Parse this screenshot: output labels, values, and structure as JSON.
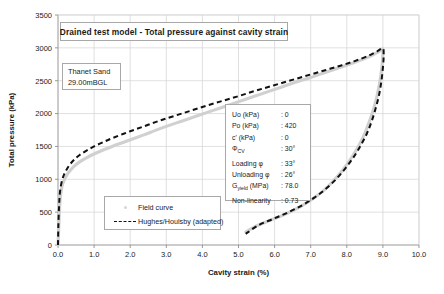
{
  "chart_data": {
    "type": "line",
    "title": "Drained test model - Total pressure against cavity strain",
    "xlabel": "Cavity strain (%)",
    "ylabel": "Total pressure (kPa)",
    "xlim": [
      0.0,
      10.0
    ],
    "ylim": [
      0,
      3500
    ],
    "xticks": [
      "0.0",
      "1.0",
      "2.0",
      "3.0",
      "4.0",
      "5.0",
      "6.0",
      "7.0",
      "8.0",
      "9.0",
      "10.0"
    ],
    "yticks": [
      "0",
      "500",
      "1000",
      "1500",
      "2000",
      "2500",
      "3000",
      "3500"
    ],
    "grid": true,
    "legend_position": "inside-left-lower",
    "series": [
      {
        "name": "Field curve",
        "style": "thick-light-gray-line",
        "color": "#d0d0d0",
        "points": [
          [
            0.0,
            0
          ],
          [
            0.02,
            250
          ],
          [
            0.04,
            520
          ],
          [
            0.06,
            700
          ],
          [
            0.09,
            830
          ],
          [
            0.13,
            930
          ],
          [
            0.18,
            1000
          ],
          [
            0.25,
            1070
          ],
          [
            0.35,
            1140
          ],
          [
            0.45,
            1200
          ],
          [
            0.6,
            1265
          ],
          [
            0.8,
            1330
          ],
          [
            1.0,
            1385
          ],
          [
            1.25,
            1445
          ],
          [
            1.5,
            1500
          ],
          [
            1.8,
            1560
          ],
          [
            2.1,
            1620
          ],
          [
            2.4,
            1680
          ],
          [
            2.7,
            1745
          ],
          [
            3.0,
            1805
          ],
          [
            3.4,
            1880
          ],
          [
            3.8,
            1955
          ],
          [
            4.2,
            2030
          ],
          [
            4.6,
            2105
          ],
          [
            5.0,
            2180
          ],
          [
            5.4,
            2255
          ],
          [
            5.8,
            2330
          ],
          [
            6.2,
            2405
          ],
          [
            6.6,
            2480
          ],
          [
            7.0,
            2550
          ],
          [
            7.4,
            2625
          ],
          [
            7.8,
            2700
          ],
          [
            8.2,
            2775
          ],
          [
            8.6,
            2860
          ],
          [
            8.9,
            2945
          ],
          [
            9.0,
            2985
          ],
          [
            9.0,
            2900
          ],
          [
            8.97,
            2700
          ],
          [
            8.92,
            2500
          ],
          [
            8.85,
            2300
          ],
          [
            8.76,
            2100
          ],
          [
            8.64,
            1900
          ],
          [
            8.5,
            1700
          ],
          [
            8.32,
            1500
          ],
          [
            8.12,
            1320
          ],
          [
            7.9,
            1150
          ],
          [
            7.65,
            990
          ],
          [
            7.38,
            840
          ],
          [
            7.05,
            700
          ],
          [
            6.7,
            580
          ],
          [
            6.3,
            470
          ],
          [
            5.9,
            380
          ],
          [
            5.5,
            290
          ],
          [
            5.2,
            200
          ]
        ]
      },
      {
        "name": "Hughes/Houlsby (adapted)",
        "style": "black-dashed-line",
        "color": "#111111",
        "points": [
          [
            0.0,
            0
          ],
          [
            0.01,
            300
          ],
          [
            0.03,
            600
          ],
          [
            0.05,
            780
          ],
          [
            0.08,
            900
          ],
          [
            0.12,
            1000
          ],
          [
            0.17,
            1075
          ],
          [
            0.24,
            1150
          ],
          [
            0.33,
            1225
          ],
          [
            0.45,
            1300
          ],
          [
            0.6,
            1370
          ],
          [
            0.8,
            1440
          ],
          [
            1.0,
            1500
          ],
          [
            1.25,
            1565
          ],
          [
            1.5,
            1625
          ],
          [
            1.8,
            1690
          ],
          [
            2.1,
            1750
          ],
          [
            2.4,
            1810
          ],
          [
            2.7,
            1870
          ],
          [
            3.0,
            1925
          ],
          [
            3.4,
            1995
          ],
          [
            3.8,
            2065
          ],
          [
            4.2,
            2135
          ],
          [
            4.6,
            2200
          ],
          [
            5.0,
            2265
          ],
          [
            5.4,
            2335
          ],
          [
            5.8,
            2400
          ],
          [
            6.2,
            2465
          ],
          [
            6.6,
            2530
          ],
          [
            7.0,
            2595
          ],
          [
            7.4,
            2660
          ],
          [
            7.8,
            2725
          ],
          [
            8.2,
            2795
          ],
          [
            8.6,
            2880
          ],
          [
            8.85,
            2950
          ],
          [
            9.0,
            2995
          ],
          [
            9.02,
            2870
          ],
          [
            9.0,
            2700
          ],
          [
            8.96,
            2500
          ],
          [
            8.9,
            2300
          ],
          [
            8.81,
            2100
          ],
          [
            8.7,
            1900
          ],
          [
            8.56,
            1700
          ],
          [
            8.38,
            1510
          ],
          [
            8.18,
            1330
          ],
          [
            7.95,
            1160
          ],
          [
            7.7,
            1000
          ],
          [
            7.42,
            855
          ],
          [
            7.1,
            720
          ],
          [
            6.75,
            600
          ],
          [
            6.35,
            490
          ],
          [
            5.95,
            395
          ],
          [
            5.55,
            300
          ],
          [
            5.2,
            170
          ]
        ]
      }
    ],
    "annotations": {
      "sand": {
        "line1": "Thanet Sand",
        "line2": "29.00mBGL"
      },
      "parameters": [
        {
          "key": "Uo (kPa)",
          "sub": "",
          "value": ": 0"
        },
        {
          "key": "Po (kPa)",
          "sub": "",
          "value": ": 420"
        },
        {
          "key": "c' (kPa)",
          "sub": "",
          "value": ": 0"
        },
        {
          "key": "Φ",
          "sub": "CV",
          "value": ": 30°"
        },
        {
          "key": "Loading φ",
          "sub": "",
          "value": ": 33°"
        },
        {
          "key": "Unloading φ",
          "sub": "",
          "value": ": 26°"
        },
        {
          "key": "G",
          "sub": "yield",
          "value": ": 78.0",
          "key_tail": " (MPa)"
        },
        {
          "key": "Non-linearity",
          "sub": "",
          "value": ": 0.73"
        }
      ]
    },
    "legend": [
      {
        "label": "Field curve",
        "marker": "dot"
      },
      {
        "label": "Hughes/Houlsby (adapted)",
        "marker": "dashed-line"
      }
    ]
  }
}
